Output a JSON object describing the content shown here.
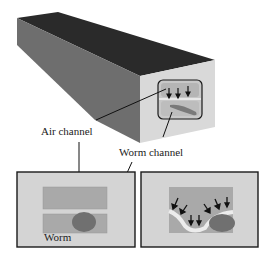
{
  "labels": {
    "air_channel": "Air channel",
    "worm_channel": "Worm channel",
    "worm": "Worm"
  },
  "colors": {
    "top_face": "#2a2a2a",
    "side_face": "#6e6e6e",
    "front_face": "#d8d8d8",
    "channel_fill": "#a9a9a9",
    "panel_bg": "#d4d4d4",
    "worm": "#707070",
    "outline": "#1a1a1a"
  },
  "panels": [
    {
      "name": "cross-section-flat",
      "description": "Air channel above worm channel, worm resting flat"
    },
    {
      "name": "cross-section-deformed",
      "description": "Membrane pushed down by air pressure, immobilizing worm"
    }
  ]
}
